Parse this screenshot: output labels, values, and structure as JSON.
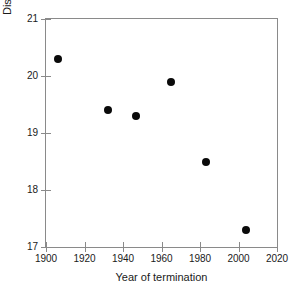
{
  "chart_data": {
    "type": "scatter",
    "title": "",
    "xlabel": "Year of termination",
    "ylabel": "Distance from head of glacier (km)",
    "xlim": [
      1900,
      2020
    ],
    "ylim": [
      17,
      21
    ],
    "xticks": [
      1900,
      1920,
      1940,
      1960,
      1980,
      2000,
      2020
    ],
    "yticks": [
      17,
      18,
      19,
      20,
      21
    ],
    "xticklabels": [
      "1900",
      "1920",
      "1940",
      "1960",
      "1980",
      "2000",
      "2020"
    ],
    "yticklabels": [
      "17",
      "18",
      "19",
      "20",
      "21"
    ],
    "grid": false,
    "legend": null,
    "marker": {
      "shape": "circle",
      "color": "#0a0a0a",
      "size_px": 8,
      "filled": true
    },
    "frame_color": "#8a8a8a",
    "points": [
      {
        "x": 1906,
        "y": 20.3
      },
      {
        "x": 1932,
        "y": 19.4
      },
      {
        "x": 1947,
        "y": 19.3
      },
      {
        "x": 1965,
        "y": 19.9
      },
      {
        "x": 1983,
        "y": 18.5
      },
      {
        "x": 2004,
        "y": 17.3
      }
    ],
    "x": [
      1906,
      1932,
      1947,
      1965,
      1983,
      2004
    ],
    "values": [
      20.3,
      19.4,
      19.3,
      19.9,
      18.5,
      17.3
    ]
  }
}
